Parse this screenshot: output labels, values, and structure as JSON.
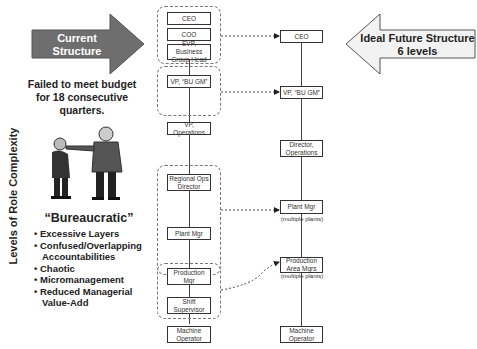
{
  "current_arrow": {
    "line1": "Current Structure",
    "line2": "10 levels",
    "color": "#6e6e6e",
    "text_color": "#ffffff"
  },
  "future_arrow": {
    "line1": "Ideal Future Structure",
    "line2": "6 levels",
    "color": "#f2f2f2",
    "text_color": "#222222"
  },
  "failed_text": {
    "line1": "Failed to meet budget",
    "line2": "for 18 consecutive",
    "line3": "quarters."
  },
  "y_axis_label": "Levels of Role Complexity",
  "bureaucratic": {
    "title": "“Bureaucratic”",
    "bullets": [
      "Excessive Layers",
      "Confused/Overlapping Accountabilities",
      "Chaotic",
      "Micromanagement",
      "Reduced Managerial Value-Add"
    ]
  },
  "current_structure": {
    "boxes": [
      "CEO",
      "COO",
      "EVP, Business Group Head",
      "VP, “BU GM”",
      "VP, Operations",
      "Regional Ops Director",
      "Plant Mgr",
      "Production Mgr",
      "Shift Supervisor",
      "Machine Operator"
    ]
  },
  "future_structure": {
    "boxes": [
      {
        "label": "CEO",
        "note": ""
      },
      {
        "label": "VP, “BU GM”",
        "note": ""
      },
      {
        "label": "Director, Operations",
        "note": ""
      },
      {
        "label": "Plant Mgr",
        "note": "(multiple plants)"
      },
      {
        "label": "Production Area Mgrs",
        "note": "(multiple plants)"
      },
      {
        "label": "Machine Operator",
        "note": ""
      }
    ]
  }
}
